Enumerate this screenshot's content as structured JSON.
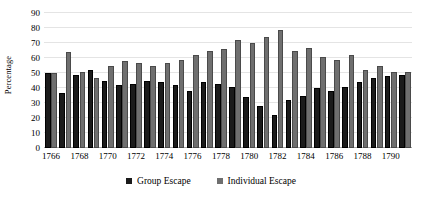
{
  "chart_data": {
    "type": "bar",
    "title": "",
    "xlabel": "",
    "ylabel": "Percentage",
    "ylim": [
      0,
      90
    ],
    "ytick_step": 10,
    "yticks": [
      0,
      10,
      20,
      30,
      40,
      50,
      60,
      70,
      80,
      90
    ],
    "grid": true,
    "legend_position": "bottom",
    "categories": [
      "1766",
      "1767",
      "1768",
      "1769",
      "1770",
      "1771",
      "1772",
      "1773",
      "1774",
      "1775",
      "1776",
      "1777",
      "1778",
      "1779",
      "1780",
      "1781",
      "1782",
      "1783",
      "1784",
      "1785",
      "1786",
      "1787",
      "1788",
      "1789",
      "1790",
      "1791"
    ],
    "xtick_labels": [
      "1766",
      "1768",
      "1770",
      "1772",
      "1774",
      "1776",
      "1778",
      "1780",
      "1782",
      "1784",
      "1786",
      "1788",
      "1790"
    ],
    "series": [
      {
        "name": "Group Escape",
        "color": "#1b1b1b",
        "values": [
          50,
          37,
          49,
          52,
          45,
          42,
          43,
          45,
          44,
          42,
          38,
          44,
          43,
          41,
          34,
          28,
          22,
          32,
          35,
          40,
          38,
          41,
          44,
          47,
          48,
          49
        ]
      },
      {
        "name": "Individual Escape",
        "color": "#6f6f6f",
        "values": [
          50,
          64,
          51,
          47,
          55,
          58,
          57,
          55,
          57,
          59,
          62,
          65,
          66,
          72,
          70,
          74,
          79,
          65,
          67,
          61,
          59,
          62,
          52,
          55,
          51,
          51
        ]
      }
    ]
  },
  "axis": {
    "y_title": "Percentage"
  },
  "legend": {
    "entries": [
      {
        "label": "Group Escape",
        "color": "#1b1b1b"
      },
      {
        "label": "Individual Escape",
        "color": "#6f6f6f"
      }
    ]
  }
}
